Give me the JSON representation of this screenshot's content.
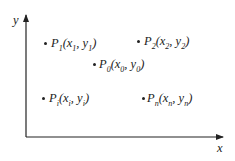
{
  "axes": {
    "x_label": "x",
    "y_label": "y"
  },
  "points": [
    {
      "id": "P1",
      "name": "P",
      "sub": "1",
      "coords": "(x",
      "csub1": "1",
      "mid": ", y",
      "csub2": "1",
      "end": ")"
    },
    {
      "id": "P2",
      "name": "P",
      "sub": "2",
      "coords": "(x",
      "csub1": "2",
      "mid": ", y",
      "csub2": "2",
      "end": ")"
    },
    {
      "id": "P0",
      "name": "P",
      "sub": "0",
      "coords": "(x",
      "csub1": "0",
      "mid": ", y",
      "csub2": "0",
      "end": ")"
    },
    {
      "id": "Pi",
      "name": "P",
      "sub": "i",
      "coords": "(x",
      "csub1": "i",
      "mid": ", y",
      "csub2": "i",
      "end": ")"
    },
    {
      "id": "Pn",
      "name": "P",
      "sub": "n",
      "coords": "(x",
      "csub1": "n",
      "mid": ", y",
      "csub2": "n",
      "end": ")"
    }
  ],
  "colors": {
    "ink": "#222222",
    "background": "#ffffff"
  }
}
